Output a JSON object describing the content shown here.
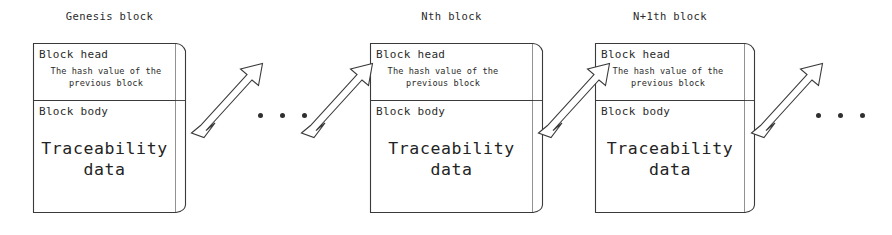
{
  "diagram": {
    "type": "blockchain-chain-structure",
    "stroke_color": "#3a3a3a",
    "text_color": "#2b2b2b",
    "background_color": "#ffffff",
    "blocks": [
      {
        "title": "Genesis block",
        "head_label": "Block head",
        "hash_line1": "The hash value of the",
        "hash_line2": "previous block",
        "body_label": "Block body",
        "data_line1": "Traceability",
        "data_line2": "data"
      },
      {
        "title": "Nth block",
        "head_label": "Block head",
        "hash_line1": "The hash value of the",
        "hash_line2": "previous block",
        "body_label": "Block body",
        "data_line1": "Traceability",
        "data_line2": "data"
      },
      {
        "title": "N+1th block",
        "head_label": "Block head",
        "hash_line1": "The hash value of the",
        "hash_line2": "previous block",
        "body_label": "Block body",
        "data_line1": "Traceability",
        "data_line2": "data"
      }
    ],
    "connectors": [
      {
        "name": "arrow-genesis-out",
        "direction": "up-right"
      },
      {
        "name": "arrow-nth-in",
        "direction": "up-right"
      },
      {
        "name": "arrow-nth-out",
        "direction": "up-right"
      },
      {
        "name": "arrow-nplus1-in",
        "direction": "up-right"
      },
      {
        "name": "arrow-nplus1-out",
        "direction": "up-right"
      }
    ],
    "ellipses": [
      {
        "name": "ellipsis-middle",
        "dots": 3
      },
      {
        "name": "ellipsis-right",
        "dots": 3
      }
    ]
  }
}
